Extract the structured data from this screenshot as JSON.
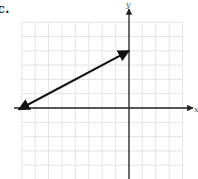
{
  "problem": {
    "part_label": "c."
  },
  "chart_data": {
    "type": "line",
    "title": "",
    "xlabel": "x",
    "ylabel": "y",
    "xlim": [
      -8,
      4
    ],
    "ylim": [
      -5,
      6
    ],
    "grid": true,
    "grid_step": 1,
    "tick_labels": false,
    "legend": null,
    "series": [
      {
        "name": "line",
        "arrows": "both",
        "points": [
          {
            "x": -8,
            "y": 0
          },
          {
            "x": 0,
            "y": 4
          }
        ]
      }
    ]
  },
  "colors": {
    "grid": "#e4e4e4",
    "axis": "#222222",
    "line": "#111111"
  }
}
